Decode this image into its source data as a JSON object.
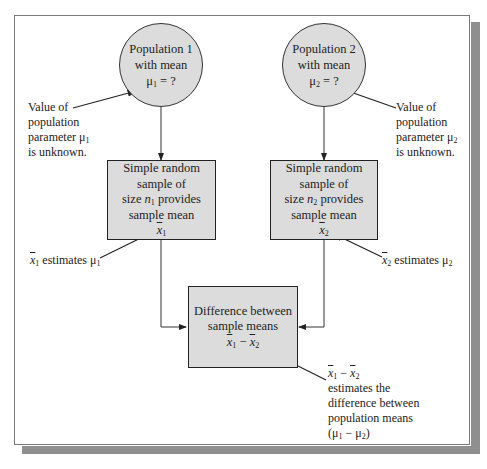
{
  "diagram": {
    "population1": {
      "line1": "Population 1",
      "line2": "with mean",
      "param": "μ",
      "sub": "1",
      "eq": " = ?"
    },
    "population2": {
      "line1": "Population 2",
      "line2": "with mean",
      "param": "μ",
      "sub": "2",
      "eq": " = ?"
    },
    "note_param1": {
      "line1": "Value of",
      "line2": "population",
      "line3": "parameter μ",
      "sub": "1",
      "line4": "is unknown."
    },
    "note_param2": {
      "line1": "Value of",
      "line2": "population",
      "line3": "parameter μ",
      "sub": "2",
      "line4": "is unknown."
    },
    "sample1": {
      "line1": "Simple random",
      "line2": "sample of",
      "line3_pre": "size ",
      "n": "n",
      "sub": "1",
      "line3_post": " provides",
      "line4": "sample mean",
      "xbar": "x",
      "xsub": "1"
    },
    "sample2": {
      "line1": "Simple random",
      "line2": "sample of",
      "line3_pre": "size ",
      "n": "n",
      "sub": "2",
      "line3_post": " provides",
      "line4": "sample mean",
      "xbar": "x",
      "xsub": "2"
    },
    "note_est1": {
      "xbar": "x",
      "xsub": "1",
      "text": " estimates μ",
      "sub": "1"
    },
    "note_est2": {
      "xbar": "x",
      "xsub": "2",
      "text": " estimates μ",
      "sub": "2"
    },
    "difference": {
      "line1": "Difference between",
      "line2": "sample means",
      "x": "x",
      "sub1": "1",
      "minus": " − ",
      "sub2": "2"
    },
    "note_diff": {
      "x": "x",
      "sub1": "1",
      "minus": " − ",
      "sub2": "2",
      "line2": "estimates the",
      "line3": "difference between",
      "line4": "population means",
      "mu_open": "(μ",
      "mu_sub1": "1",
      "mu_minus": " − μ",
      "mu_sub2": "2",
      "mu_close": ")"
    }
  }
}
